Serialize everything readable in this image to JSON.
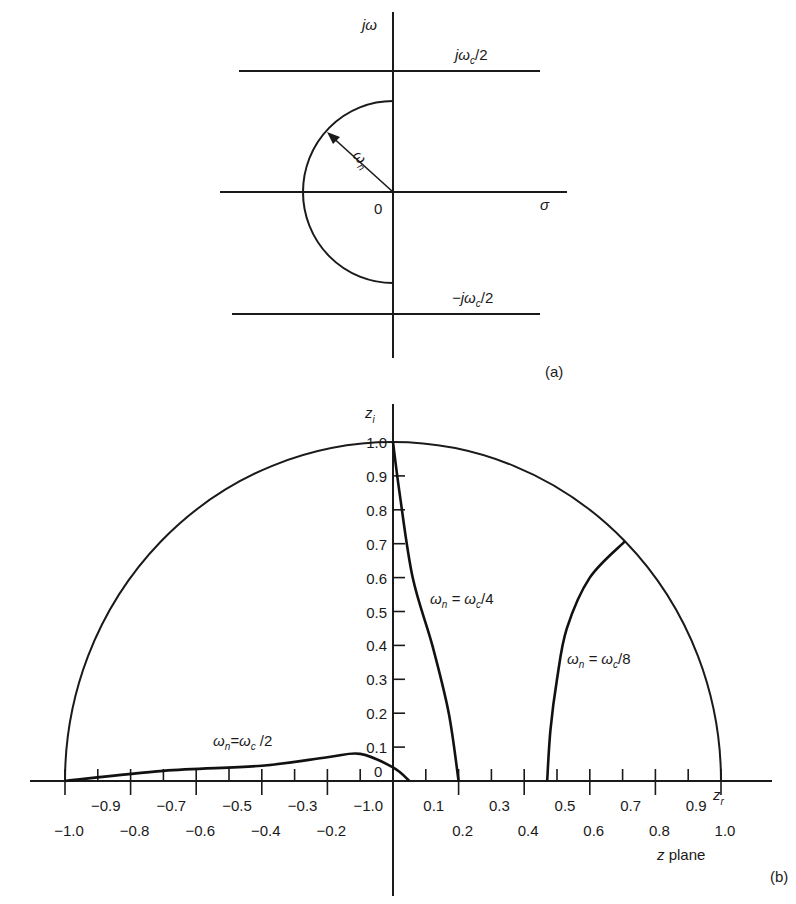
{
  "panel_a": {
    "label": "(a)",
    "y_axis_label": "jω",
    "x_axis_label": "σ",
    "origin_label": "0",
    "upper_line_label": "jω",
    "upper_line_sub": "c",
    "upper_line_suffix": "/2",
    "lower_line_label": "−jω",
    "lower_line_sub": "c",
    "lower_line_suffix": "/2",
    "radius_label": "ω",
    "radius_sub": "n"
  },
  "panel_b": {
    "label": "(b)",
    "plane_label": "z plane",
    "y_axis_label": "z",
    "y_axis_sub": "i",
    "x_axis_label": "z",
    "x_axis_sub": "r",
    "origin_label": "0",
    "y_ticks": [
      "1.0",
      "0.9",
      "0.8",
      "0.7",
      "0.6",
      "0.5",
      "0.4",
      "0.3",
      "0.2",
      "0.1"
    ],
    "x_ticks_upper": [
      "−0.9",
      "−0.7",
      "−0.5",
      "−0.3",
      "−1.0",
      "0.1",
      "0.3",
      "0.5",
      "0.7",
      "0.9"
    ],
    "x_ticks_lower": [
      "−1.0",
      "−0.8",
      "−0.6",
      "−0.4",
      "−0.2",
      "0.2",
      "0.4",
      "0.6",
      "0.8",
      "1.0"
    ],
    "curve_labels": [
      {
        "prefix": "ω",
        "sub1": "n",
        "mid": " = ω",
        "sub2": "c",
        "suffix": "/4"
      },
      {
        "prefix": "ω",
        "sub1": "n",
        "mid": " = ω",
        "sub2": "c",
        "suffix": "/8"
      },
      {
        "prefix": "ω",
        "sub1": "n",
        "mid": "=ω",
        "sub2": "c",
        "suffix": " /2"
      }
    ]
  },
  "chart_data": {
    "type": "line",
    "title": "",
    "xlabel": "z_r",
    "ylabel": "z_i",
    "xlim": [
      -1.0,
      1.0
    ],
    "ylim": [
      0,
      1.0
    ],
    "grid": false,
    "series": [
      {
        "name": "unit circle",
        "x": [
          -1.0,
          -0.707,
          0,
          0.707,
          1.0
        ],
        "y": [
          0,
          0.707,
          1.0,
          0.707,
          0
        ]
      },
      {
        "name": "ωn = ωc/4",
        "x": [
          0.0,
          0.02,
          0.06,
          0.12,
          0.17,
          0.2
        ],
        "y": [
          1.0,
          0.85,
          0.6,
          0.4,
          0.2,
          0.0
        ]
      },
      {
        "name": "ωn = ωc/8",
        "x": [
          0.707,
          0.6,
          0.53,
          0.5,
          0.48,
          0.47
        ],
        "y": [
          0.707,
          0.6,
          0.45,
          0.3,
          0.15,
          0.0
        ]
      },
      {
        "name": "ωn = ωc/2",
        "x": [
          -1.0,
          -0.7,
          -0.4,
          -0.2,
          -0.1,
          0.0,
          0.05
        ],
        "y": [
          0.0,
          0.03,
          0.045,
          0.07,
          0.08,
          0.04,
          0.0
        ]
      }
    ]
  }
}
